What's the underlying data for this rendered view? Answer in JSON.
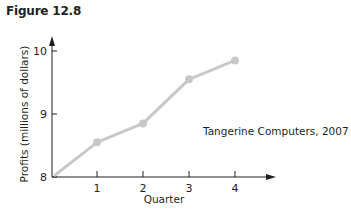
{
  "figure": {
    "title": "Figure 12.8"
  },
  "chart_data": {
    "type": "line",
    "title": "Figure 12.8",
    "xlabel": "Quarter",
    "ylabel": "Profits (millions of dollars)",
    "x": [
      0,
      1,
      2,
      3,
      4
    ],
    "categories": [
      "",
      "1",
      "2",
      "3",
      "4"
    ],
    "series": [
      {
        "name": "Tangerine Computers, 2007",
        "values": [
          8.03,
          8.55,
          8.85,
          9.55,
          9.85
        ],
        "color": "#c8c8c8",
        "markers": [
          false,
          true,
          true,
          true,
          true
        ]
      }
    ],
    "x_ticks": [
      "1",
      "2",
      "3",
      "4"
    ],
    "y_ticks": [
      "8",
      "9",
      "10"
    ],
    "ylim": [
      8,
      10
    ],
    "xlim": [
      0,
      4
    ],
    "grid": false,
    "legend": "none",
    "annotations": [
      "Tangerine Computers, 2007"
    ],
    "axis_arrows": true
  },
  "colors": {
    "line": "#c8c8c8",
    "axis": "#231f20",
    "text": "#231f20"
  }
}
